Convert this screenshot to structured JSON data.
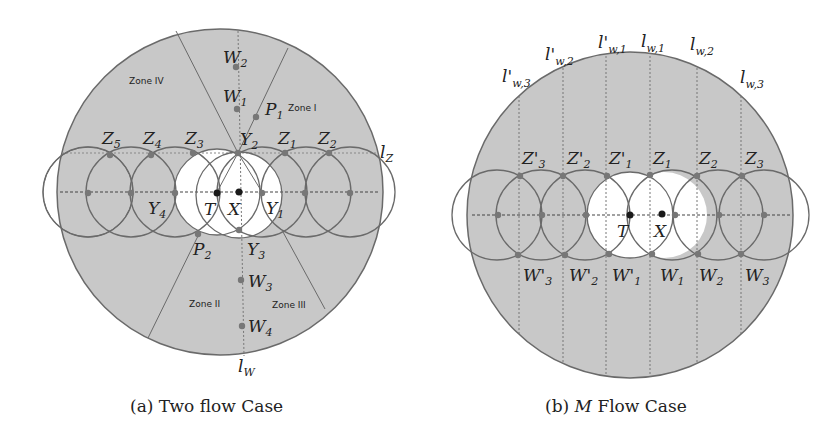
{
  "figure_a": {
    "caption": "(a) Two flow Case",
    "zones": [
      "Zone I",
      "Zone II",
      "Zone III",
      "Zone IV"
    ],
    "points": {
      "W2": {
        "base": "W",
        "sub": "2"
      },
      "W1": {
        "base": "W",
        "sub": "1"
      },
      "P1": {
        "base": "P",
        "sub": "1"
      },
      "Y2": {
        "base": "Y",
        "sub": "2"
      },
      "Z1": {
        "base": "Z",
        "sub": "1"
      },
      "Z2": {
        "base": "Z",
        "sub": "2"
      },
      "Z3": {
        "base": "Z",
        "sub": "3"
      },
      "Z4": {
        "base": "Z",
        "sub": "4"
      },
      "Z5": {
        "base": "Z",
        "sub": "5"
      },
      "Y1": {
        "base": "Y",
        "sub": "1"
      },
      "Y4": {
        "base": "Y",
        "sub": "4"
      },
      "T": {
        "base": "T",
        "sub": ""
      },
      "X": {
        "base": "X",
        "sub": ""
      },
      "P2": {
        "base": "P",
        "sub": "2"
      },
      "Y3": {
        "base": "Y",
        "sub": "3"
      },
      "W3": {
        "base": "W",
        "sub": "3"
      },
      "W4": {
        "base": "W",
        "sub": "4"
      }
    },
    "lines": {
      "lz": {
        "base": "l",
        "sub": "Z"
      },
      "lw": {
        "base": "l",
        "sub": "W"
      }
    }
  },
  "figure_b": {
    "caption_prefix": "(b) ",
    "caption_var": "M",
    "caption_suffix": " Flow Case",
    "lines": {
      "lp_w3": {
        "base": "l'",
        "sub": "w,3"
      },
      "lp_w2": {
        "base": "l'",
        "sub": "w,2"
      },
      "lp_w1": {
        "base": "l'",
        "sub": "w,1"
      },
      "l_w1": {
        "base": "l",
        "sub": "w,1"
      },
      "l_w2": {
        "base": "l",
        "sub": "w,2"
      },
      "l_w3": {
        "base": "l",
        "sub": "w,3"
      }
    },
    "points": {
      "Zp3": {
        "base": "Z'",
        "sub": "3"
      },
      "Zp2": {
        "base": "Z'",
        "sub": "2"
      },
      "Zp1": {
        "base": "Z'",
        "sub": "1"
      },
      "Z1": {
        "base": "Z",
        "sub": "1"
      },
      "Z2": {
        "base": "Z",
        "sub": "2"
      },
      "Z3": {
        "base": "Z",
        "sub": "3"
      },
      "Wp3": {
        "base": "W'",
        "sub": "3"
      },
      "Wp2": {
        "base": "W'",
        "sub": "2"
      },
      "Wp1": {
        "base": "W'",
        "sub": "1"
      },
      "W1": {
        "base": "W",
        "sub": "1"
      },
      "W2": {
        "base": "W",
        "sub": "2"
      },
      "W3": {
        "base": "W",
        "sub": "3"
      },
      "T": {
        "base": "T",
        "sub": ""
      },
      "X": {
        "base": "X",
        "sub": ""
      }
    }
  },
  "colors": {
    "region_fill": "#c8c8c8",
    "stroke": "#6a6a6a",
    "point": "#777777",
    "key_point": "#1a1a1a"
  }
}
